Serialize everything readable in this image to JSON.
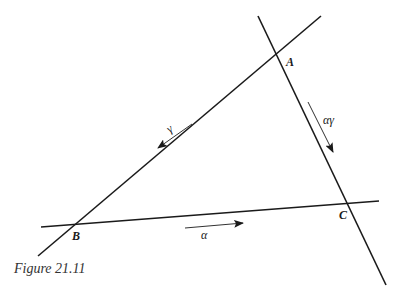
{
  "figure": {
    "caption": "Figure 21.11",
    "points": {
      "A": {
        "label": "A",
        "x": 284,
        "y": 53
      },
      "B": {
        "label": "B",
        "x": 77,
        "y": 226
      },
      "C": {
        "label": "C",
        "x": 347,
        "y": 203
      }
    },
    "lines": [
      {
        "name": "line-ab",
        "x1": 38,
        "y1": 256,
        "x2": 321,
        "y2": 16
      },
      {
        "name": "line-ac",
        "x1": 258,
        "y1": 16,
        "x2": 386,
        "y2": 285
      },
      {
        "name": "line-bc",
        "x1": 41,
        "y1": 227,
        "x2": 379,
        "y2": 201
      }
    ],
    "arrows": [
      {
        "name": "gamma-arrow",
        "label": "γ",
        "x1": 192,
        "y1": 124,
        "x2": 158,
        "y2": 148
      },
      {
        "name": "alpha-gamma-arrow",
        "label": "αγ",
        "x1": 308,
        "y1": 102,
        "x2": 333,
        "y2": 152
      },
      {
        "name": "alpha-arrow",
        "label": "α",
        "x1": 185,
        "y1": 228,
        "x2": 243,
        "y2": 223
      }
    ],
    "colors": {
      "line": "#1a1a1a",
      "background": "#ffffff"
    }
  }
}
